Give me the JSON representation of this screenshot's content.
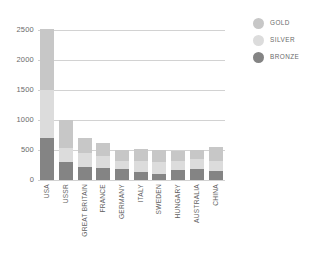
{
  "chart_data": {
    "type": "bar",
    "subtype": "stacked-vertical",
    "title": "",
    "subtitle": "",
    "xlabel": "",
    "ylabel": "",
    "ylim": [
      0,
      2500
    ],
    "yticks": [
      0,
      500,
      1000,
      1500,
      2000,
      2500
    ],
    "ytick_labels": [
      "0",
      "500",
      "1000",
      "1500",
      "2000",
      "2500"
    ],
    "grid": true,
    "grid_axis": "y",
    "legend_position": "right-top",
    "categories": [
      "USA",
      "USSR",
      "GREAT BRITAIN",
      "FRANCE",
      "GERMANY",
      "ITALY",
      "SWEDEN",
      "HUNGARY",
      "AUSTRALIA",
      "CHINA"
    ],
    "series": [
      {
        "name": "GOLD",
        "color": "#c7c7c7",
        "values": [
          1022,
          473,
          236,
          212,
          186,
          206,
          193,
          175,
          147,
          224
        ]
      },
      {
        "name": "SILVER",
        "color": "#dcdcdc",
        "values": [
          795,
          226,
          238,
          200,
          127,
          178,
          203,
          147,
          163,
          167
        ]
      },
      {
        "name": "BRONZE",
        "color": "#848484",
        "values": [
          705,
          300,
          220,
          200,
          184,
          140,
          105,
          170,
          187,
          155
        ]
      }
    ],
    "totals": [
      2522,
      999,
      694,
      612,
      497,
      524,
      501,
      492,
      497,
      546
    ],
    "bar_colors": {
      "gold": "#c7c7c7",
      "silver": "#dcdcdc",
      "bronze": "#848484"
    },
    "axis_color": "#d2d2d2",
    "text_color": "#6a6a6a"
  },
  "legend": {
    "items": [
      {
        "label": "GOLD",
        "color": "#c7c7c7"
      },
      {
        "label": "SILVER",
        "color": "#dcdcdc"
      },
      {
        "label": "BRONZE",
        "color": "#848484"
      }
    ]
  }
}
